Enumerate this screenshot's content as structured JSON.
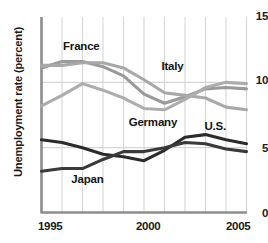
{
  "chart_data": {
    "type": "line",
    "title": "",
    "xlabel": "",
    "ylabel": "Unemployment rate (percent)",
    "xlim": [
      1995,
      2005
    ],
    "ylim": [
      0,
      15
    ],
    "x": [
      1995,
      1996,
      1997,
      1998,
      1999,
      2000,
      2001,
      2002,
      2003,
      2004,
      2005
    ],
    "yticks": [
      0,
      5,
      10,
      15
    ],
    "xticks": [
      1995,
      2000,
      2005
    ],
    "xtick_labels": [
      "1995",
      "2000",
      "2005"
    ],
    "ytick_labels": [
      "0",
      "5",
      "10",
      "15"
    ],
    "grid": "vertical-and-horizontal",
    "legend": "inline-labels",
    "series": [
      {
        "name": "France",
        "color": "#9a9a9a",
        "label_x": 1996.1,
        "label_y": 12.7,
        "values": [
          11.1,
          11.6,
          11.6,
          11.2,
          10.5,
          9.1,
          8.4,
          8.9,
          9.5,
          9.6,
          9.5
        ]
      },
      {
        "name": "Italy",
        "color": "#a8a8a8",
        "label_x": 2000.9,
        "label_y": 11.2,
        "values": [
          11.3,
          11.3,
          11.5,
          11.5,
          11.1,
          10.2,
          9.2,
          9.0,
          8.8,
          8.1,
          7.9
        ]
      },
      {
        "name": "Germany",
        "color": "#adadad",
        "label_x": 1999.3,
        "label_y": 6.9,
        "values": [
          8.2,
          9.0,
          9.9,
          9.4,
          8.8,
          8.0,
          7.9,
          8.7,
          9.6,
          10.0,
          9.9
        ]
      },
      {
        "name": "U.S.",
        "color": "#2b2b2b",
        "label_x": 2003.0,
        "label_y": 6.6,
        "values": [
          5.6,
          5.4,
          5.0,
          4.5,
          4.3,
          4.0,
          4.8,
          5.8,
          6.0,
          5.6,
          5.3
        ]
      },
      {
        "name": "Japan",
        "color": "#3a3a3a",
        "label_x": 1996.5,
        "label_y": 2.5,
        "values": [
          3.2,
          3.4,
          3.4,
          4.1,
          4.7,
          4.7,
          5.0,
          5.4,
          5.3,
          4.9,
          4.7
        ]
      }
    ]
  }
}
